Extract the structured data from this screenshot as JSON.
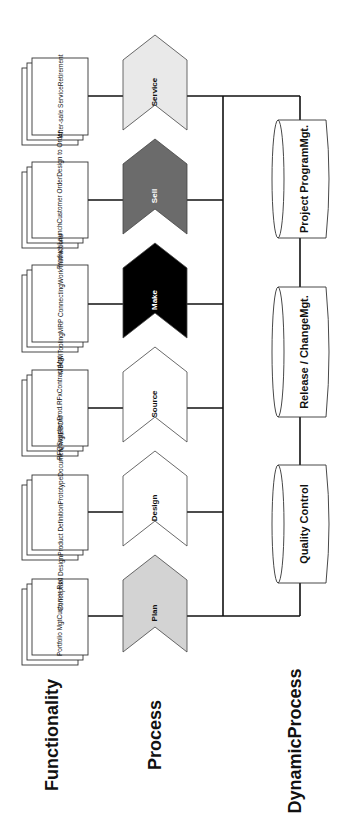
{
  "row_labels": {
    "functionality": "Functionality",
    "process": "Process",
    "dynamic_process_line1": "Dynamic",
    "dynamic_process_line2": "Process"
  },
  "stages": [
    {
      "name": "Service",
      "fill": "#e9e9e9",
      "text_color": "#111111",
      "functionality": [
        "After-sale Service",
        "Retirement"
      ]
    },
    {
      "name": "Sell",
      "fill": "#6b6b6b",
      "text_color": "#ffffff",
      "functionality": [
        "Product Launch",
        "Customer Order",
        "Design to Order"
      ]
    },
    {
      "name": "Make",
      "fill": "#000000",
      "text_color": "#ffffff",
      "functionality": [
        "MBOM",
        "Tooling",
        "MRP Connecting",
        "Work Instructions"
      ]
    },
    {
      "name": "Source",
      "fill": "#ffffff",
      "text_color": "#111111",
      "functionality": [
        "RFQ",
        "Supplier Prod.",
        "RFx",
        "Contract Mgt"
      ]
    },
    {
      "name": "Design",
      "fill": "#ffffff",
      "text_color": "#111111",
      "functionality": [
        "Conceptual Design",
        "Product Definition",
        "Prototype",
        "Document Mgt",
        "EBOM"
      ]
    },
    {
      "name": "Plan",
      "fill": "#d3d3d3",
      "text_color": "#111111",
      "functionality": [
        "Portfolio Mgt",
        "Customer Rec"
      ]
    }
  ],
  "dynamic_processes": [
    {
      "line1": "Project Program",
      "line2": "Mgt."
    },
    {
      "line1": "Release / Change",
      "line2": "Mgt."
    },
    {
      "line1": "Quality Control",
      "line2": ""
    }
  ]
}
